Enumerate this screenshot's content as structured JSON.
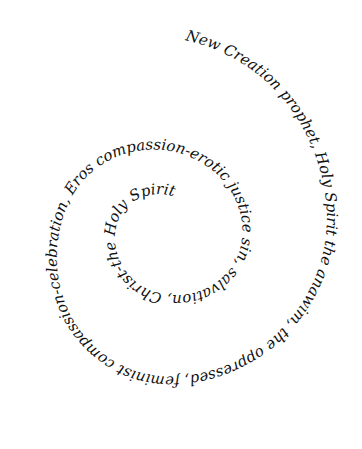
{
  "image": {
    "type": "calligraphic spiral text",
    "background": "#ffffff",
    "ink_color": "#111111"
  },
  "spiral": {
    "segments": [
      {
        "text": "New Creation  prophet, Holy Spirit  the anawim, the oppressed, feminist  compassion-celebration, Eros  compassion-erotic justice  sin, salvation, Christ-the Holy Spirit"
      }
    ],
    "phrases": [
      "New Creation",
      "prophet, Holy Spirit",
      "the anawim, the oppressed, feminist",
      "compassion-celebration, Eros",
      "compassion-erotic justice",
      "sin, salvation, Christ-the Holy",
      "Spirit"
    ]
  }
}
